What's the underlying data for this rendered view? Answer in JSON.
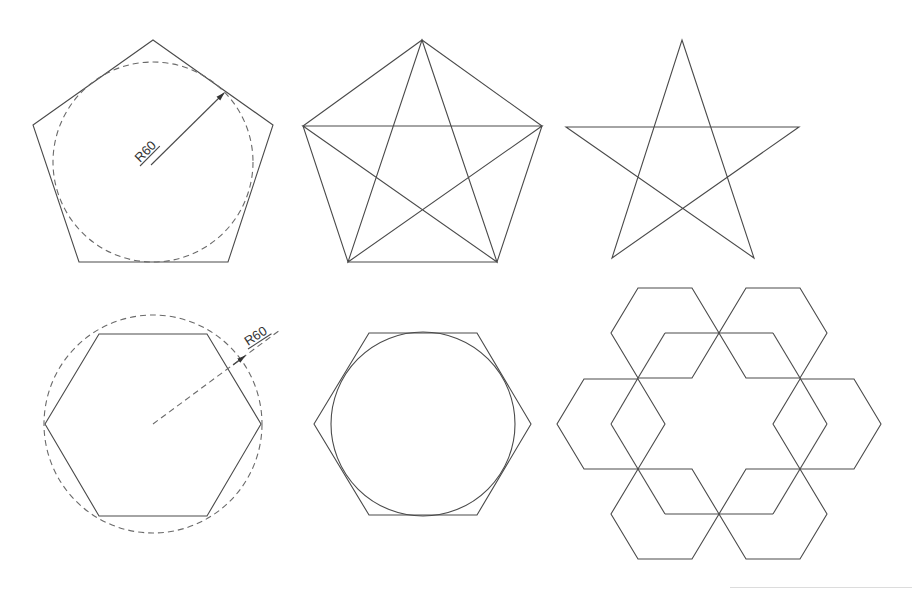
{
  "colors": {
    "background": "#ffffff",
    "stroke": "#4a4a4a",
    "dashed": "#6a6a6a",
    "text": "#333333"
  },
  "figures": [
    {
      "id": "pentagon-circumscribed",
      "type": "polygon",
      "points": [
        [
          153,
          40
        ],
        [
          273,
          125
        ],
        [
          228,
          262
        ],
        [
          79,
          262
        ],
        [
          33,
          125
        ]
      ],
      "circle": {
        "cx": 153,
        "cy": 162,
        "r": 100,
        "dashed": true
      },
      "dimension": {
        "label": "R60",
        "line": [
          [
            151,
            165
          ],
          [
            224,
            93
          ]
        ],
        "arrow_at": [
          224,
          93
        ],
        "dashed": false,
        "text_pos": [
          140,
          163
        ],
        "text_rotate": -45
      }
    },
    {
      "id": "pentagon-with-star",
      "type": "polygon",
      "points": [
        [
          422,
          40
        ],
        [
          542,
          126
        ],
        [
          497,
          262
        ],
        [
          348,
          262
        ],
        [
          303,
          126
        ]
      ],
      "star": [
        [
          422,
          40
        ],
        [
          497,
          262
        ],
        [
          303,
          126
        ],
        [
          542,
          126
        ],
        [
          348,
          262
        ]
      ]
    },
    {
      "id": "pentagram",
      "type": "star",
      "star": [
        [
          682,
          40
        ],
        [
          754,
          258
        ],
        [
          566,
          127
        ],
        [
          799,
          127
        ],
        [
          612,
          258
        ]
      ]
    },
    {
      "id": "hexagon-inscribed-in-circle",
      "type": "polygon",
      "points": [
        [
          45,
          424
        ],
        [
          99,
          334
        ],
        [
          207,
          334
        ],
        [
          261,
          424
        ],
        [
          207,
          516
        ],
        [
          99,
          516
        ]
      ],
      "circle": {
        "cx": 153,
        "cy": 424,
        "r": 109,
        "dashed": true
      },
      "dimension": {
        "label": "R60",
        "line": [
          [
            153,
            424
          ],
          [
            280,
            330
          ]
        ],
        "arrow_at": [
          245,
          356
        ],
        "dashed": true,
        "text_pos": [
          248,
          346
        ],
        "text_rotate": -33
      }
    },
    {
      "id": "hexagon-with-inscribed-circle",
      "type": "polygon",
      "points": [
        [
          314,
          424
        ],
        [
          369,
          333
        ],
        [
          477,
          333
        ],
        [
          531,
          424
        ],
        [
          477,
          515
        ],
        [
          369,
          515
        ]
      ],
      "circle": {
        "cx": 423,
        "cy": 424,
        "r": 92,
        "dashed": false
      }
    }
  ],
  "hex_ring": {
    "id": "six-hexagon-ring",
    "r": 54,
    "h": 45,
    "hexagons": [
      {
        "cx": 665,
        "cy": 333,
        "spokes": [
          [
            719,
            333
          ],
          [
            638,
            378
          ]
        ]
      },
      {
        "cx": 773,
        "cy": 333,
        "spokes": [
          [
            719,
            333
          ],
          [
            800,
            378
          ]
        ]
      },
      {
        "cx": 611,
        "cy": 424,
        "spokes": [
          [
            638,
            378
          ],
          [
            638,
            469
          ]
        ]
      },
      {
        "cx": 827,
        "cy": 424,
        "spokes": [
          [
            800,
            378
          ],
          [
            800,
            469
          ]
        ]
      },
      {
        "cx": 665,
        "cy": 514,
        "spokes": [
          [
            719,
            514
          ],
          [
            638,
            469
          ]
        ]
      },
      {
        "cx": 773,
        "cy": 514,
        "spokes": [
          [
            719,
            514
          ],
          [
            800,
            469
          ]
        ]
      }
    ]
  },
  "footer_rule": {
    "x": 730,
    "y": 587,
    "width": 182
  }
}
